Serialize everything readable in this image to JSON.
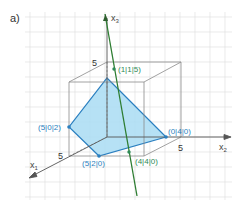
{
  "part_label": "a)",
  "axes": {
    "x1": "x",
    "x1_sub": "1",
    "x2": "x",
    "x2_sub": "2",
    "x3": "x",
    "x3_sub": "3"
  },
  "tick_labels": {
    "x3_five": "5",
    "x1_five": "5",
    "x2_five": "5"
  },
  "points": [
    {
      "id": "p115",
      "label": "(1|1|5)",
      "color": "#2e8b57"
    },
    {
      "id": "p502",
      "label": "(5|0|2)",
      "color": "#2a7fc0"
    },
    {
      "id": "p040",
      "label": "(0|4|0)",
      "color": "#2a7fc0"
    },
    {
      "id": "p520",
      "label": "(5|2|0)",
      "color": "#2a7fc0"
    },
    {
      "id": "p440",
      "label": "(4|4|0)",
      "color": "#2e8b57"
    }
  ],
  "colors": {
    "grid": "#d8d8d8",
    "cube": "#8a8a8a",
    "polygon_fill": "#a9dcf3",
    "polygon_stroke": "#2a7fc0",
    "line": "#2e7d32",
    "axis": "#555555"
  }
}
